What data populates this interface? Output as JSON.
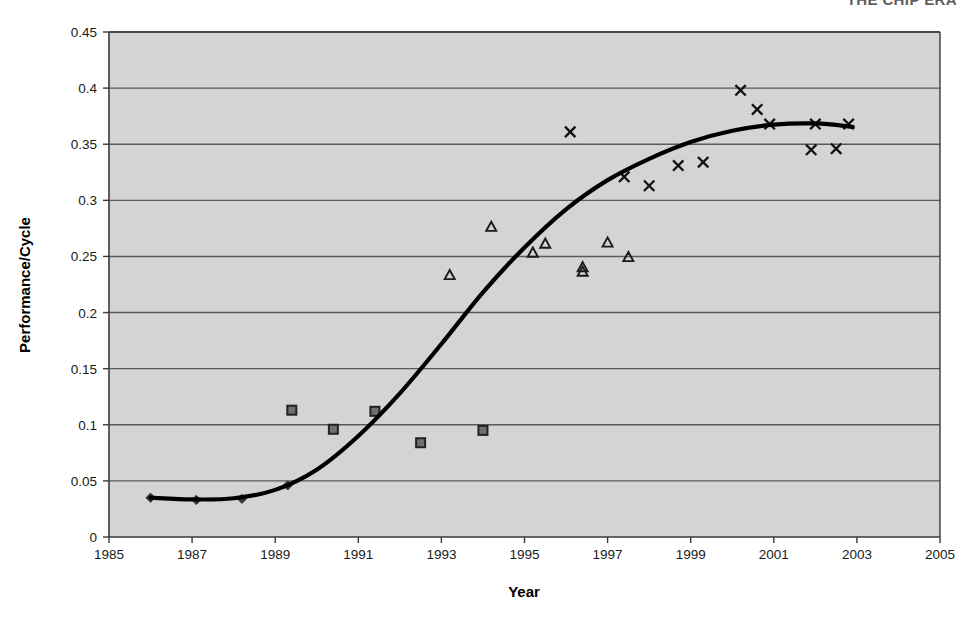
{
  "figure": {
    "header_cutoff_text": "THE CHIP ERA",
    "background_color": "#ffffff",
    "plot_background_color": "#d4d4d4",
    "line_color": "#000000",
    "marker_color": "#333333",
    "grid_color": "#5a5a5a",
    "axis_color": "#3a3a3a"
  },
  "chart_data": {
    "type": "scatter",
    "title": "",
    "xlabel": "Year",
    "ylabel": "Performance/Cycle",
    "xlim": [
      1985,
      2005
    ],
    "ylim": [
      0,
      0.45
    ],
    "xticks": [
      1985,
      1987,
      1989,
      1991,
      1993,
      1995,
      1997,
      1999,
      2001,
      2003,
      2005
    ],
    "xtick_labels": [
      "1985",
      "1987",
      "1989",
      "1991",
      "1993",
      "1995",
      "1997",
      "1999",
      "2001",
      "2003",
      "2005"
    ],
    "yticks": [
      0,
      0.05,
      0.1,
      0.15,
      0.2,
      0.25,
      0.3,
      0.35,
      0.4,
      0.45
    ],
    "ytick_labels": [
      "0",
      "0.05",
      "0.1",
      "0.15",
      "0.2",
      "0.25",
      "0.3",
      "0.35",
      "0.4",
      "0.45"
    ],
    "grid": "horizontal",
    "legend": "none",
    "legend_position": "none",
    "annotations": [],
    "series": [
      {
        "name": "diamond-series",
        "marker": "diamond",
        "filled": true,
        "points": [
          {
            "x": 1986.0,
            "y": 0.035
          },
          {
            "x": 1987.1,
            "y": 0.033
          },
          {
            "x": 1988.2,
            "y": 0.034
          },
          {
            "x": 1989.3,
            "y": 0.046
          }
        ]
      },
      {
        "name": "square-series",
        "marker": "square",
        "filled": true,
        "points": [
          {
            "x": 1989.4,
            "y": 0.113
          },
          {
            "x": 1990.4,
            "y": 0.096
          },
          {
            "x": 1991.4,
            "y": 0.112
          },
          {
            "x": 1992.5,
            "y": 0.084
          },
          {
            "x": 1994.0,
            "y": 0.095
          }
        ]
      },
      {
        "name": "triangle-series",
        "marker": "triangle",
        "filled": false,
        "points": [
          {
            "x": 1993.2,
            "y": 0.233
          },
          {
            "x": 1994.2,
            "y": 0.276
          },
          {
            "x": 1995.2,
            "y": 0.253
          },
          {
            "x": 1995.5,
            "y": 0.261
          },
          {
            "x": 1996.4,
            "y": 0.24
          },
          {
            "x": 1996.4,
            "y": 0.236
          },
          {
            "x": 1997.0,
            "y": 0.262
          },
          {
            "x": 1997.5,
            "y": 0.249
          }
        ]
      },
      {
        "name": "cross-series",
        "marker": "x",
        "filled": true,
        "points": [
          {
            "x": 1996.1,
            "y": 0.361
          },
          {
            "x": 1997.4,
            "y": 0.321
          },
          {
            "x": 1998.0,
            "y": 0.313
          },
          {
            "x": 1998.7,
            "y": 0.331
          },
          {
            "x": 1999.3,
            "y": 0.334
          },
          {
            "x": 2000.2,
            "y": 0.398
          },
          {
            "x": 2000.6,
            "y": 0.381
          },
          {
            "x": 2000.9,
            "y": 0.368
          },
          {
            "x": 2002.0,
            "y": 0.368
          },
          {
            "x": 2001.9,
            "y": 0.345
          },
          {
            "x": 2002.5,
            "y": 0.346
          },
          {
            "x": 2002.8,
            "y": 0.368
          }
        ]
      },
      {
        "name": "trend-curve",
        "marker": "none",
        "line": true,
        "points": [
          {
            "x": 1986.0,
            "y": 0.035
          },
          {
            "x": 1987.0,
            "y": 0.0335
          },
          {
            "x": 1988.0,
            "y": 0.0345
          },
          {
            "x": 1989.0,
            "y": 0.042
          },
          {
            "x": 1990.0,
            "y": 0.06
          },
          {
            "x": 1991.0,
            "y": 0.09
          },
          {
            "x": 1992.0,
            "y": 0.128
          },
          {
            "x": 1993.0,
            "y": 0.172
          },
          {
            "x": 1994.0,
            "y": 0.218
          },
          {
            "x": 1995.0,
            "y": 0.258
          },
          {
            "x": 1996.0,
            "y": 0.292
          },
          {
            "x": 1997.0,
            "y": 0.318
          },
          {
            "x": 1998.0,
            "y": 0.337
          },
          {
            "x": 1999.0,
            "y": 0.352
          },
          {
            "x": 2000.0,
            "y": 0.362
          },
          {
            "x": 2001.0,
            "y": 0.3675
          },
          {
            "x": 2002.0,
            "y": 0.3685
          },
          {
            "x": 2002.9,
            "y": 0.3655
          }
        ]
      }
    ]
  }
}
